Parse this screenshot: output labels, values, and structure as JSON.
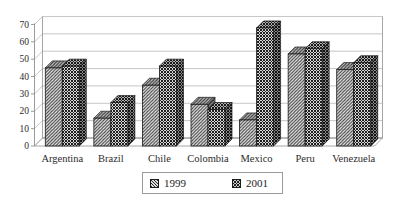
{
  "chart_data": {
    "type": "bar",
    "style": "3d-clustered-column-hatched-monochrome",
    "title": "",
    "xlabel": "",
    "ylabel": "",
    "categories": [
      "Argentina",
      "Brazil",
      "Chile",
      "Colombia",
      "Mexico",
      "Peru",
      "Venezuela"
    ],
    "series": [
      {
        "name": "1999",
        "values": [
          45,
          16,
          35,
          24,
          15,
          53,
          44
        ]
      },
      {
        "name": "2001",
        "values": [
          46,
          25,
          46,
          21,
          68,
          56,
          48
        ]
      }
    ],
    "ylim": [
      0,
      70
    ],
    "ytick_step": 10,
    "yticks": [
      0,
      10,
      20,
      30,
      40,
      50,
      60,
      70
    ],
    "grid": true,
    "legend_position": "bottom-center",
    "colors": {
      "background": "#ffffff",
      "gridline": "#b8b8b8",
      "axis": "#8f8f8f",
      "bar_outline": "#1a1a1a",
      "hatch_light_bg": "#ececec",
      "hatch_light_line": "#3c3c3c",
      "hatch_dark_bg": "#d8d8d8",
      "hatch_dark_line": "#1f1f1f",
      "text": "#2b2b2b",
      "legend_border": "#9a9a9a"
    }
  },
  "legend": {
    "items": [
      {
        "label": "1999"
      },
      {
        "label": "2001"
      }
    ]
  }
}
